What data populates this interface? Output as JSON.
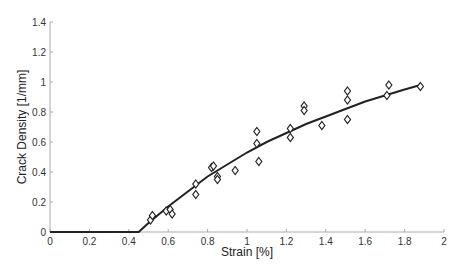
{
  "chart_data": {
    "type": "scatter",
    "title": "",
    "xlabel": "Strain [%]",
    "ylabel": "Crack Density [1/mm]",
    "xlim": [
      0,
      2
    ],
    "ylim": [
      0,
      1.4
    ],
    "xticks": [
      0,
      0.2,
      0.4,
      0.6,
      0.8,
      1,
      1.2,
      1.4,
      1.6,
      1.8,
      2
    ],
    "yticks": [
      0,
      0.2,
      0.4,
      0.6,
      0.8,
      1,
      1.2,
      1.4
    ],
    "xtick_labels": [
      "0",
      "0.2",
      "0.4",
      "0.6",
      "0.8",
      "1",
      "1.2",
      "1.4",
      "1.6",
      "1.8",
      "2"
    ],
    "ytick_labels": [
      "0",
      "0.2",
      "0.4",
      "0.6",
      "0.8",
      "1",
      "1.2",
      "1.4"
    ],
    "grid": false,
    "legend": null,
    "series": [
      {
        "name": "Measured",
        "marker": "diamond",
        "points": [
          [
            0.51,
            0.08
          ],
          [
            0.52,
            0.11
          ],
          [
            0.59,
            0.14
          ],
          [
            0.61,
            0.15
          ],
          [
            0.62,
            0.12
          ],
          [
            0.74,
            0.25
          ],
          [
            0.74,
            0.32
          ],
          [
            0.82,
            0.43
          ],
          [
            0.83,
            0.44
          ],
          [
            0.85,
            0.37
          ],
          [
            0.85,
            0.35
          ],
          [
            0.94,
            0.41
          ],
          [
            1.05,
            0.67
          ],
          [
            1.05,
            0.59
          ],
          [
            1.06,
            0.47
          ],
          [
            1.22,
            0.69
          ],
          [
            1.22,
            0.63
          ],
          [
            1.29,
            0.84
          ],
          [
            1.29,
            0.81
          ],
          [
            1.38,
            0.71
          ],
          [
            1.51,
            0.94
          ],
          [
            1.51,
            0.88
          ],
          [
            1.51,
            0.75
          ],
          [
            1.71,
            0.91
          ],
          [
            1.72,
            0.98
          ],
          [
            1.88,
            0.97
          ]
        ]
      },
      {
        "name": "Model fit",
        "type": "line",
        "points": [
          [
            0,
            0
          ],
          [
            0.45,
            0
          ],
          [
            0.5,
            0.06
          ],
          [
            0.6,
            0.17
          ],
          [
            0.7,
            0.27
          ],
          [
            0.8,
            0.37
          ],
          [
            0.9,
            0.45
          ],
          [
            1.0,
            0.53
          ],
          [
            1.1,
            0.6
          ],
          [
            1.2,
            0.66
          ],
          [
            1.3,
            0.72
          ],
          [
            1.4,
            0.77
          ],
          [
            1.5,
            0.82
          ],
          [
            1.6,
            0.87
          ],
          [
            1.7,
            0.91
          ],
          [
            1.8,
            0.95
          ],
          [
            1.88,
            0.98
          ]
        ]
      }
    ]
  }
}
